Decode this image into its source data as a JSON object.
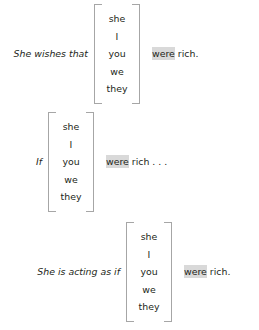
{
  "page": {
    "background_color": "#ffffff",
    "text_color": "#231f20",
    "bracket_color": "#a6a6a6",
    "highlight_color": "#d9d9d9"
  },
  "examples": [
    {
      "lead_in": "She wishes that",
      "pronouns": [
        "she",
        "I",
        "you",
        "we",
        "they"
      ],
      "highlighted_word": "were",
      "tail_text": " rich."
    },
    {
      "lead_in": "If",
      "pronouns": [
        "she",
        "I",
        "you",
        "we",
        "they"
      ],
      "highlighted_word": "were",
      "tail_text": " rich . . ."
    },
    {
      "lead_in": "She is acting as if",
      "pronouns": [
        "she",
        "I",
        "you",
        "we",
        "they"
      ],
      "highlighted_word": "were",
      "tail_text": " rich."
    }
  ]
}
